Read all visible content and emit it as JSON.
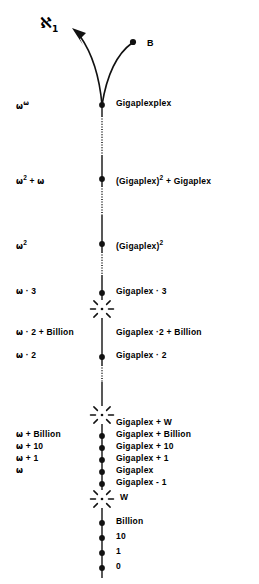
{
  "figure": {
    "background": "#ffffff",
    "ink": "#111111",
    "axis_x": 102,
    "width": 259,
    "height": 584
  },
  "top_markers": {
    "aleph_label": "ℵ",
    "aleph_subscript": "1",
    "aleph_x": 40,
    "aleph_y": 14,
    "b_label": "B",
    "b_label_x": 147,
    "b_label_y": 38,
    "b_dot_x": 133,
    "b_dot_y": 42,
    "arrow_tip_x": 72,
    "arrow_tip_y": 29
  },
  "rows": [
    {
      "id": "gigaplexplex",
      "y": 105,
      "node": "dot",
      "left_parts": [
        {
          "t": "ω",
          "s": "om"
        },
        {
          "t": "ω",
          "s": "omsup"
        }
      ],
      "left_x": 16,
      "right": "Gigaplexplex",
      "right_parts": [
        {
          "t": "Gigaplexplex",
          "s": "n"
        }
      ]
    },
    {
      "id": "gigaplex-sq-plus-gigaplex",
      "y": 179,
      "node": "dot",
      "left_parts": [
        {
          "t": "ω",
          "s": "om"
        },
        {
          "t": "2",
          "s": "sup"
        },
        {
          "t": " + ",
          "s": "n"
        },
        {
          "t": "ω",
          "s": "om"
        }
      ],
      "left_x": 16,
      "right": "(Gigaplex)2 + Gigaplex",
      "right_parts": [
        {
          "t": "(Gigaplex)",
          "s": "n"
        },
        {
          "t": "2",
          "s": "sup"
        },
        {
          "t": " + Gigaplex",
          "s": "n"
        }
      ]
    },
    {
      "id": "gigaplex-squared",
      "y": 244,
      "node": "dot",
      "left_parts": [
        {
          "t": "ω",
          "s": "om"
        },
        {
          "t": "2",
          "s": "sup"
        }
      ],
      "left_x": 16,
      "right": "(Gigaplex)2",
      "right_parts": [
        {
          "t": "(Gigaplex)",
          "s": "n"
        },
        {
          "t": "2",
          "s": "sup"
        }
      ]
    },
    {
      "id": "gigaplex-times-3",
      "y": 293,
      "node": "dot",
      "left_parts": [
        {
          "t": "ω",
          "s": "om"
        },
        {
          "t": " · 3",
          "s": "n"
        }
      ],
      "left_x": 16,
      "right": "Gigaplex · 3",
      "right_parts": [
        {
          "t": "Gigaplex · 3",
          "s": "n"
        }
      ]
    },
    {
      "id": "burst-upper",
      "y": 309,
      "node": "burst",
      "left_parts": [],
      "left_x": 16,
      "right": "",
      "right_parts": []
    },
    {
      "id": "gigaplex-times-2-plus-billion",
      "y": 334,
      "node": "none",
      "left_parts": [
        {
          "t": "ω",
          "s": "om"
        },
        {
          "t": " · 2 + Billion",
          "s": "n"
        }
      ],
      "left_x": 16,
      "right": "Gigaplex ·2 + Billion",
      "right_parts": [
        {
          "t": "Gigaplex ·2 + Billion",
          "s": "n"
        }
      ]
    },
    {
      "id": "gigaplex-times-2",
      "y": 357,
      "node": "dot",
      "left_parts": [
        {
          "t": "ω",
          "s": "om"
        },
        {
          "t": " · 2",
          "s": "n"
        }
      ],
      "left_x": 16,
      "right": "Gigaplex · 2",
      "right_parts": [
        {
          "t": "Gigaplex · 2",
          "s": "n"
        }
      ]
    },
    {
      "id": "burst-middle",
      "y": 415,
      "node": "burst",
      "left_parts": [],
      "left_x": 16,
      "right": "",
      "right_parts": []
    },
    {
      "id": "gigaplex-plus-w",
      "y": 424,
      "node": "none",
      "left_parts": [],
      "left_x": 16,
      "right": "Gigaplex + W",
      "right_parts": [
        {
          "t": "Gigaplex + W",
          "s": "n"
        }
      ]
    },
    {
      "id": "gigaplex-plus-billion",
      "y": 436,
      "node": "dot",
      "left_parts": [
        {
          "t": "ω",
          "s": "om"
        },
        {
          "t": " + Billion",
          "s": "n"
        }
      ],
      "left_x": 16,
      "right": "Gigaplex + Billion",
      "right_parts": [
        {
          "t": "Gigaplex + Billion",
          "s": "n"
        }
      ]
    },
    {
      "id": "gigaplex-plus-10",
      "y": 448,
      "node": "dot",
      "left_parts": [
        {
          "t": "ω",
          "s": "om"
        },
        {
          "t": " + 10",
          "s": "n"
        }
      ],
      "left_x": 16,
      "right": "Gigaplex + 10",
      "right_parts": [
        {
          "t": "Gigaplex + 10",
          "s": "n"
        }
      ]
    },
    {
      "id": "gigaplex-plus-1",
      "y": 460,
      "node": "dot",
      "left_parts": [
        {
          "t": "ω",
          "s": "om"
        },
        {
          "t": " + 1",
          "s": "n"
        }
      ],
      "left_x": 16,
      "right": "Gigaplex + 1",
      "right_parts": [
        {
          "t": "Gigaplex + 1",
          "s": "n"
        }
      ]
    },
    {
      "id": "gigaplex",
      "y": 472,
      "node": "dot",
      "left_parts": [
        {
          "t": "ω",
          "s": "om"
        }
      ],
      "left_x": 16,
      "right": "Gigaplex",
      "right_parts": [
        {
          "t": "Gigaplex",
          "s": "n"
        }
      ]
    },
    {
      "id": "gigaplex-minus-1",
      "y": 484,
      "node": "dot",
      "left_parts": [],
      "left_x": 16,
      "right": "Gigaplex - 1",
      "right_parts": [
        {
          "t": "Gigaplex - 1",
          "s": "n"
        }
      ]
    },
    {
      "id": "burst-lower",
      "y": 499,
      "node": "burst",
      "left_parts": [],
      "left_x": 16,
      "right": "W",
      "right_parts": [
        {
          "t": "W",
          "s": "n"
        }
      ],
      "right_x": 120
    },
    {
      "id": "billion",
      "y": 523,
      "node": "dot",
      "left_parts": [],
      "left_x": 16,
      "right": "Billion",
      "right_parts": [
        {
          "t": "Billion",
          "s": "n"
        }
      ]
    },
    {
      "id": "ten",
      "y": 538,
      "node": "dot",
      "left_parts": [],
      "left_x": 16,
      "right": "10",
      "right_parts": [
        {
          "t": "10",
          "s": "n"
        }
      ]
    },
    {
      "id": "one",
      "y": 553,
      "node": "dot",
      "left_parts": [],
      "left_x": 16,
      "right": "1",
      "right_parts": [
        {
          "t": "1",
          "s": "n"
        }
      ]
    },
    {
      "id": "zero",
      "y": 568,
      "node": "dot",
      "left_parts": [],
      "left_x": 16,
      "right": "0",
      "right_parts": [
        {
          "t": "0",
          "s": "n"
        }
      ]
    }
  ],
  "axis_segments": [
    {
      "y1": 105,
      "y2": 116,
      "style": "solid"
    },
    {
      "y1": 116,
      "y2": 155,
      "style": "dotted"
    },
    {
      "y1": 155,
      "y2": 186,
      "style": "solid"
    },
    {
      "y1": 186,
      "y2": 215,
      "style": "dotted"
    },
    {
      "y1": 215,
      "y2": 252,
      "style": "solid"
    },
    {
      "y1": 252,
      "y2": 275,
      "style": "dotted"
    },
    {
      "y1": 275,
      "y2": 300,
      "style": "solid"
    },
    {
      "y1": 318,
      "y2": 365,
      "style": "solid"
    },
    {
      "y1": 365,
      "y2": 382,
      "style": "dotted"
    },
    {
      "y1": 382,
      "y2": 406,
      "style": "solid"
    },
    {
      "y1": 424,
      "y2": 490,
      "style": "solid"
    },
    {
      "y1": 508,
      "y2": 578,
      "style": "solid"
    }
  ]
}
